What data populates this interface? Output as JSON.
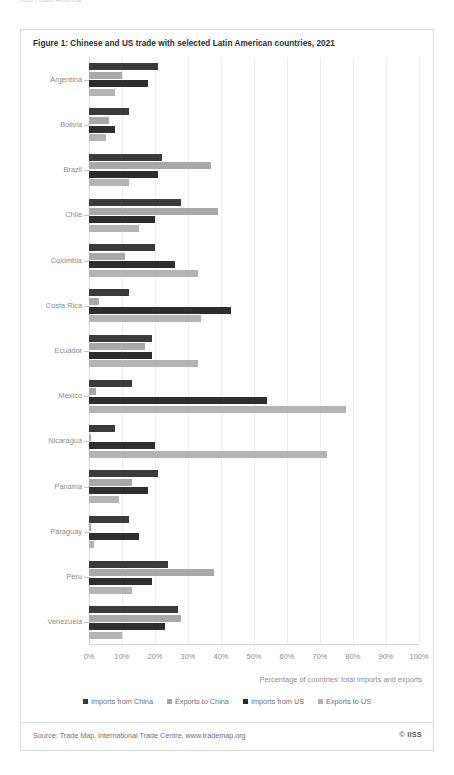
{
  "running_head": "IISS  |  Latin America",
  "figure": {
    "title": "Figure 1: Chinese and US trade with selected Latin American countries, 2021",
    "source": "Source: Trade Map, International Trade Centre, www.trademap.org",
    "credit": "© IISS"
  },
  "axis_caption": "Percentage of countries' total imports and exports",
  "legend": {
    "position": "bottom-center",
    "items": [
      {
        "label": "Imports from China",
        "color": "#3b3b3b"
      },
      {
        "label": "Exports to China",
        "color": "#a8a8a8"
      },
      {
        "label": "Imports from US",
        "color": "#2e2e2e"
      },
      {
        "label": "Exports to US",
        "color": "#b3b3b3"
      }
    ]
  },
  "chart_data": {
    "type": "bar",
    "orientation": "horizontal",
    "title": "Figure 1: Chinese and US trade with selected Latin American countries, 2021",
    "xlabel": "Percentage of countries' total imports and exports",
    "ylabel": "",
    "xlim": [
      0,
      100
    ],
    "xticks": [
      0,
      10,
      20,
      30,
      40,
      50,
      60,
      70,
      80,
      90,
      100
    ],
    "xtick_labels": [
      "0%",
      "10%",
      "20%",
      "30%",
      "40%",
      "50%",
      "60%",
      "70%",
      "80%",
      "90%",
      "100%"
    ],
    "grid": true,
    "legend_position": "bottom-center",
    "categories": [
      "Argentina",
      "Bolivia",
      "Brazil",
      "Chile",
      "Colombia",
      "Costa Rica",
      "Ecuador",
      "Mexico",
      "Nicaragua",
      "Panama",
      "Paraguay",
      "Peru",
      "Venezuela"
    ],
    "series": [
      {
        "name": "Imports from China",
        "color": "#3b3b3b",
        "values": [
          21,
          12,
          22,
          28,
          20,
          12,
          19,
          13,
          8,
          21,
          12,
          24,
          27
        ]
      },
      {
        "name": "Exports to China",
        "color": "#a8a8a8",
        "values": [
          10,
          6,
          37,
          39,
          11,
          3,
          17,
          2,
          0.5,
          13,
          0.5,
          38,
          28
        ]
      },
      {
        "name": "Imports from US",
        "color": "#2e2e2e",
        "values": [
          18,
          8,
          21,
          20,
          26,
          43,
          19,
          54,
          20,
          18,
          15,
          19,
          23
        ]
      },
      {
        "name": "Exports to US",
        "color": "#b3b3b3",
        "values": [
          8,
          5,
          12,
          15,
          33,
          34,
          33,
          78,
          72,
          9,
          1.5,
          13,
          10
        ]
      }
    ]
  }
}
